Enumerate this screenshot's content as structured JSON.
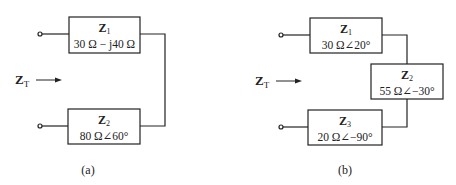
{
  "diagram_a": {
    "caption": "(a)",
    "input_label": "Z",
    "input_label_sub": "T",
    "z1": {
      "name": "Z",
      "sub": "1",
      "value": "30 Ω − j40 Ω"
    },
    "z2": {
      "name": "Z",
      "sub": "2",
      "value": "80 Ω∠60°"
    }
  },
  "diagram_b": {
    "caption": "(b)",
    "input_label": "Z",
    "input_label_sub": "T",
    "z1": {
      "name": "Z",
      "sub": "1",
      "value": "30 Ω∠20°"
    },
    "z2": {
      "name": "Z",
      "sub": "2",
      "value": "55 Ω∠−30°"
    },
    "z3": {
      "name": "Z",
      "sub": "3",
      "value": "20 Ω∠−90°"
    }
  },
  "colors": {
    "line": "#222222",
    "background": "#ffffff"
  }
}
